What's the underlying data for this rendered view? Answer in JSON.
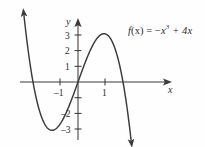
{
  "figure": {
    "title": "",
    "background_color": "#fefefe",
    "stroke_color": "#3b3b3b",
    "equation": {
      "full_text": "f(x) = −x³ + 4x",
      "lhs": "f",
      "lhs_arg": "(x)",
      "equals": "=",
      "term1_sign": "−",
      "term1_base": "x",
      "term1_exponent": "3",
      "term2": "+ 4x"
    },
    "x_axis": {
      "name": "x",
      "tick_labels": [
        "–1",
        "1"
      ],
      "tick_values": [
        -1,
        1
      ]
    },
    "y_axis": {
      "name": "y",
      "tick_labels": [
        "3",
        "2",
        "1",
        "–2",
        "–3"
      ],
      "tick_values": [
        3,
        2,
        1,
        -2,
        -3
      ]
    }
  },
  "chart_data": {
    "type": "line",
    "title": "",
    "xlabel": "x",
    "ylabel": "y",
    "annotations": [
      "f(x) = −x³ + 4x"
    ],
    "legend": [],
    "grid": false,
    "xlim": [
      -3.2,
      5.0
    ],
    "ylim": [
      -3.8,
      3.9
    ],
    "xticks": [
      -1,
      1
    ],
    "xticklabels": [
      "–1",
      "1"
    ],
    "yticks": [
      3,
      2,
      1,
      -2,
      -3
    ],
    "yticklabels": [
      "3",
      "2",
      "1",
      "–2",
      "–3"
    ],
    "roots": [
      -2,
      0,
      2
    ],
    "local_minimum": [
      -1.155,
      -3.079
    ],
    "local_maximum": [
      1.155,
      3.079
    ],
    "series": [
      {
        "name": "f(x) = −x³ + 4x",
        "color": "#3b3b3b",
        "x": [
          -3.15,
          -3.0,
          -2.8,
          -2.6,
          -2.4,
          -2.2,
          -2.0,
          -1.8,
          -1.6,
          -1.4,
          -1.2,
          -1.0,
          -0.8,
          -0.6,
          -0.4,
          -0.2,
          0.0,
          0.2,
          0.4,
          0.6,
          0.8,
          1.0,
          1.2,
          1.4,
          1.6,
          1.8,
          2.0,
          2.2,
          2.4,
          2.6,
          2.8,
          3.0,
          3.2,
          3.4
        ],
        "y": [
          18.66,
          15.0,
          10.75,
          7.18,
          4.22,
          1.85,
          0.0,
          -1.37,
          -2.3,
          -2.86,
          -3.07,
          -3.0,
          -2.69,
          -2.18,
          -1.54,
          -0.79,
          0.0,
          0.79,
          1.54,
          2.18,
          2.69,
          3.0,
          3.07,
          2.86,
          2.3,
          1.37,
          0.0,
          -1.85,
          -4.22,
          -7.18,
          -10.75,
          -15.0,
          -19.97,
          -25.71
        ]
      }
    ]
  }
}
